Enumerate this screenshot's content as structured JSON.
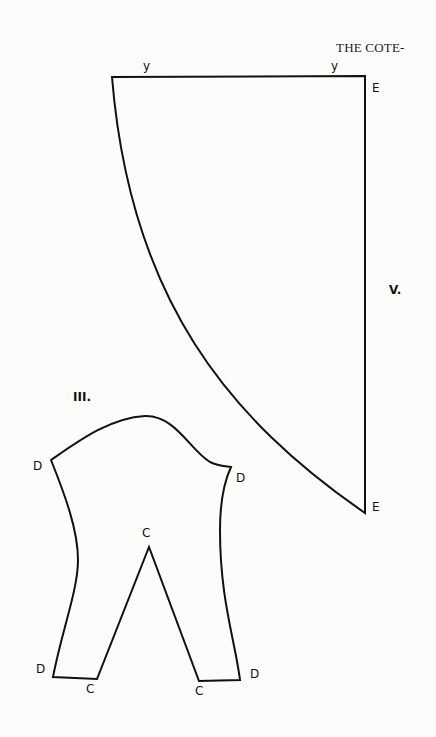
{
  "header": {
    "running_title": "THE COTE-"
  },
  "figure_v": {
    "label": "V.",
    "top_labels": [
      "y",
      "y"
    ],
    "corner_labels": [
      "E",
      "E"
    ]
  },
  "figure_iii": {
    "label": "III.",
    "point_labels": {
      "d_top_left": "D",
      "d_top_right": "D",
      "c_apex": "C",
      "d_bottom_left": "D",
      "c_bottom_left": "C",
      "c_bottom_right": "C",
      "d_bottom_right": "D"
    }
  }
}
